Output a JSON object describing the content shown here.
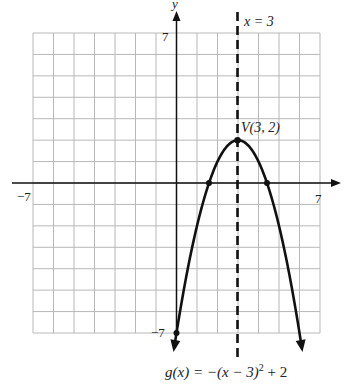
{
  "chart_data": {
    "type": "line",
    "title": "",
    "xlabel": "x",
    "ylabel": "y",
    "xlim": [
      -7,
      7
    ],
    "ylim": [
      -7,
      7
    ],
    "grid": true,
    "tick_labels": {
      "x_min": "−7",
      "x_max": "7",
      "y_max": "7",
      "y_min": "−7"
    },
    "series": [
      {
        "name": "g(x) = −(x − 3)² + 2",
        "function": "-(x-3)^2+2",
        "x": [
          0,
          1,
          1.586,
          2,
          3,
          4,
          4.414,
          5,
          6
        ],
        "values": [
          -7,
          -2,
          0,
          1,
          2,
          1,
          0,
          -2,
          -7
        ]
      }
    ],
    "marked_points": [
      {
        "x": 3,
        "y": 2,
        "label": "V(3, 2)"
      },
      {
        "x": 1.586,
        "y": 0
      },
      {
        "x": 4.414,
        "y": 0
      },
      {
        "x": 0,
        "y": -7
      }
    ],
    "axis_of_symmetry": {
      "x": 3,
      "label": "x = 3",
      "style": "dashed"
    },
    "annotations": {
      "vertex_label": "V(3, 2)",
      "symmetry_label": "x = 3",
      "function_label": "g(x) = −(x − 3)² + 2"
    }
  },
  "labels": {
    "y_axis": "y",
    "y_top": "7",
    "y_bottom": "−7",
    "x_left": "−7",
    "x_right": "7",
    "symmetry": "x = 3",
    "vertex": "V(3, 2)",
    "func_g": "g(x) = −(x − 3)",
    "func_sup": "2",
    "func_tail": " + 2"
  }
}
